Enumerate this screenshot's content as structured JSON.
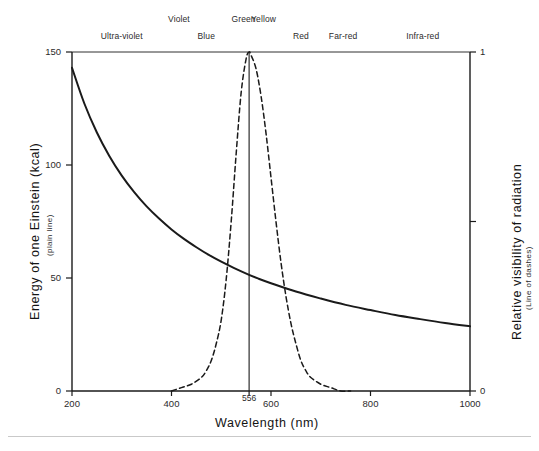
{
  "figure": {
    "background_color": "#ffffff",
    "line_color": "#1a1a1a"
  },
  "bands": {
    "upper_row": [
      {
        "label": "Violet",
        "x_nm": 415
      },
      {
        "label": "Green",
        "x_nm": 545
      },
      {
        "label": "Yellow",
        "x_nm": 585
      }
    ],
    "lower_row": [
      {
        "label": "Ultra-violet",
        "x_nm": 300
      },
      {
        "label": "Blue",
        "x_nm": 470
      },
      {
        "label": "Red",
        "x_nm": 660
      },
      {
        "label": "Far-red",
        "x_nm": 745
      },
      {
        "label": "Infra-red",
        "x_nm": 905
      }
    ]
  },
  "chart_data": {
    "type": "line",
    "title": "",
    "xlabel": "Wavelength  (nm)",
    "xlim": [
      200,
      1000
    ],
    "xticks": [
      200,
      400,
      556,
      600,
      800,
      1000
    ],
    "xtick_labels": [
      "200",
      "400",
      "556",
      "600",
      "800",
      "1000"
    ],
    "grid": false,
    "legend": "none",
    "left_axis": {
      "label": "Energy of one Einstein (kcal)",
      "sublabel": "(plain line)",
      "lim": [
        0,
        150
      ],
      "ticks": [
        0,
        50,
        100,
        150
      ],
      "tick_labels": [
        "0",
        "50",
        "100",
        "150"
      ]
    },
    "right_axis": {
      "label": "Relative visibility of radiation",
      "sublabel": "(Line of dashes)",
      "lim": [
        0,
        1
      ],
      "ticks": [
        0,
        0.5,
        1
      ],
      "tick_labels": [
        "0",
        "",
        "1"
      ]
    },
    "marker_line": {
      "x_nm": 556,
      "label": "556",
      "style": "vertical-solid"
    },
    "series": [
      {
        "name": "Energy of one Einstein (kcal)",
        "style": "solid",
        "axis": "left",
        "x": [
          200,
          225,
          250,
          275,
          300,
          325,
          350,
          375,
          400,
          425,
          450,
          475,
          500,
          525,
          556,
          575,
          600,
          650,
          700,
          750,
          800,
          850,
          900,
          950,
          1000
        ],
        "y": [
          143.0,
          127.1,
          114.4,
          104.0,
          95.3,
          88.0,
          81.7,
          76.3,
          71.5,
          67.3,
          63.6,
          60.2,
          57.2,
          54.5,
          51.4,
          49.7,
          47.7,
          44.0,
          40.9,
          38.1,
          35.8,
          33.6,
          31.8,
          30.1,
          28.6
        ]
      },
      {
        "name": "Relative visibility of radiation",
        "style": "dashed",
        "axis": "right",
        "x": [
          400,
          420,
          440,
          460,
          470,
          480,
          490,
          500,
          510,
          520,
          530,
          540,
          550,
          556,
          560,
          570,
          580,
          590,
          600,
          610,
          620,
          630,
          640,
          650,
          660,
          670,
          680,
          700,
          720,
          740,
          760
        ],
        "y": [
          0.0,
          0.01,
          0.02,
          0.04,
          0.06,
          0.09,
          0.14,
          0.21,
          0.33,
          0.5,
          0.7,
          0.88,
          0.98,
          1.0,
          0.99,
          0.95,
          0.87,
          0.76,
          0.63,
          0.5,
          0.38,
          0.28,
          0.2,
          0.14,
          0.09,
          0.06,
          0.04,
          0.02,
          0.01,
          0.0,
          0.0
        ]
      }
    ]
  }
}
